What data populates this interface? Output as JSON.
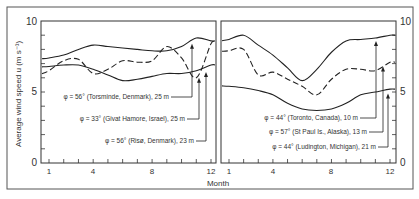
{
  "chart_data": [
    {
      "type": "line",
      "panel": "left",
      "xlabel": "Month",
      "ylabel": "Average wind speed u (m s^-1)",
      "ylim": [
        0,
        10
      ],
      "yticks": [
        "0",
        "5",
        "10"
      ],
      "xticks": [
        "1",
        "4",
        "8",
        "12"
      ],
      "x": [
        1,
        2,
        3,
        4,
        5,
        6,
        7,
        8,
        9,
        10,
        11,
        12
      ],
      "series": [
        {
          "name": "φ = 56° (Torsminde, Denmark), 25 m",
          "style": "solid",
          "values": [
            7.4,
            7.6,
            8.0,
            8.3,
            8.2,
            8.1,
            8.0,
            7.9,
            7.9,
            8.2,
            8.8,
            8.6
          ]
        },
        {
          "name": "φ = 33° (Givat Hamore, Israel), 25 m",
          "style": "dashed",
          "values": [
            6.5,
            7.2,
            7.3,
            6.3,
            6.6,
            7.2,
            7.1,
            7.2,
            8.2,
            7.4,
            6.0,
            8.4
          ]
        },
        {
          "name": "φ = 56° (Risø, Denmark), 23 m",
          "style": "solid",
          "values": [
            6.8,
            6.9,
            6.9,
            6.6,
            6.2,
            5.8,
            5.9,
            6.1,
            6.3,
            6.3,
            6.5,
            6.9
          ]
        }
      ]
    },
    {
      "type": "line",
      "panel": "right",
      "xlabel": "Month",
      "ylim": [
        0,
        10
      ],
      "yticks": [
        "0",
        "5",
        "10"
      ],
      "xticks": [
        "1",
        "4",
        "8",
        "12"
      ],
      "x": [
        1,
        2,
        3,
        4,
        5,
        6,
        7,
        8,
        9,
        10,
        11,
        12
      ],
      "series": [
        {
          "name": "φ = 44° (Toronto, Canada), 10 m",
          "style": "solid",
          "values": [
            8.7,
            9.0,
            8.3,
            7.6,
            6.7,
            5.8,
            6.6,
            7.8,
            8.6,
            8.7,
            8.8,
            9.0
          ]
        },
        {
          "name": "φ = 57° (St Paul Is., Alaska), 13 m",
          "style": "dashed",
          "values": [
            7.9,
            8.0,
            6.2,
            6.4,
            5.9,
            5.4,
            4.8,
            5.9,
            6.6,
            6.6,
            6.5,
            7.1
          ]
        },
        {
          "name": "φ = 44° (Ludington, Michigan), 21 m",
          "style": "solid",
          "values": [
            5.4,
            5.3,
            5.1,
            4.8,
            4.2,
            3.8,
            3.7,
            3.8,
            4.2,
            4.8,
            5.0,
            5.2
          ]
        }
      ]
    }
  ],
  "labels": {
    "ylabel": "Average wind speed  u  (m s⁻¹)",
    "xlabel": "Month",
    "left_annotations": [
      "φ = 56° (Torsminde, Denmark), 25 m",
      "φ = 33° (Givat Hamore, Israel), 25 m",
      "φ = 56° (Risø, Denmark), 23 m"
    ],
    "right_annotations": [
      "φ = 44° (Toronto, Canada), 10 m",
      "φ = 57° (St Paul Is., Alaska), 13 m",
      "φ = 44° (Ludington, Michigan), 21 m"
    ],
    "y_top": "10",
    "y_mid": "5",
    "y_bot": "0",
    "x1": "1",
    "x4": "4",
    "x8": "8",
    "x12": "12"
  }
}
